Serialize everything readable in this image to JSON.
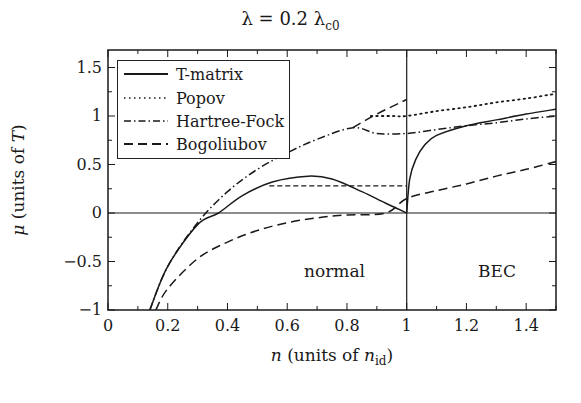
{
  "chart_data": {
    "type": "line",
    "title_main": "λ = 0.2 λ",
    "title_sub": "c0",
    "xlabel": "n (units of n_id)",
    "xlabel_main": "n",
    "xlabel_text": " (units of ",
    "xlabel_var": "n",
    "xlabel_sub": "id",
    "xlabel_close": ")",
    "ylabel": "μ (units of T)",
    "xlim": [
      0,
      1.5
    ],
    "ylim": [
      -1,
      1.7
    ],
    "xticks": [
      "0",
      "0.2",
      "0.4",
      "0.6",
      "0.8",
      "1",
      "1.2",
      "1.4"
    ],
    "yticks": [
      "1.5",
      "1",
      "0.5",
      "0",
      "−0.5",
      "−1"
    ],
    "grid": false,
    "legend_position": "upper left",
    "annotations": [
      {
        "text": "normal",
        "x": 0.75,
        "y": -0.6
      },
      {
        "text": "BEC",
        "x": 1.3,
        "y": -0.6
      }
    ],
    "reference_lines": [
      {
        "type": "horizontal",
        "y": 0
      },
      {
        "type": "vertical",
        "x": 1
      }
    ],
    "series": [
      {
        "name": "T-matrix",
        "style": "solid",
        "x": [
          0.14,
          0.2,
          0.3,
          0.37,
          0.45,
          0.55,
          0.67,
          0.75,
          0.85,
          0.93,
          1.0,
          1.0,
          1.01,
          1.03,
          1.06,
          1.1,
          1.2,
          1.3,
          1.4,
          1.5
        ],
        "values": [
          -1.0,
          -0.55,
          -0.12,
          0.0,
          0.18,
          0.32,
          0.38,
          0.35,
          0.22,
          0.1,
          0.0,
          0.0,
          0.35,
          0.55,
          0.7,
          0.8,
          0.9,
          0.96,
          1.02,
          1.07
        ],
        "extra": {
          "maxwell_plateau": {
            "mu": 0.28,
            "from": 0.54,
            "to": 1.0
          }
        }
      },
      {
        "name": "Popov",
        "style": "dotted",
        "x": [
          0.88,
          0.95,
          1.0,
          1.1,
          1.2,
          1.3,
          1.4,
          1.5
        ],
        "values": [
          1.0,
          1.0,
          1.0,
          1.05,
          1.09,
          1.14,
          1.18,
          1.23
        ]
      },
      {
        "name": "Hartree-Fock",
        "style": "dash-dot",
        "x": [
          0.14,
          0.2,
          0.3,
          0.4,
          0.5,
          0.6,
          0.7,
          0.82,
          0.9,
          1.0,
          1.1,
          1.2,
          1.3,
          1.4,
          1.5
        ],
        "values": [
          -1.0,
          -0.55,
          -0.1,
          0.22,
          0.45,
          0.62,
          0.76,
          0.88,
          0.82,
          0.82,
          0.86,
          0.9,
          0.93,
          0.97,
          1.0
        ]
      },
      {
        "name": "Bogoliubov",
        "style": "dashed",
        "x": [
          0.16,
          0.2,
          0.3,
          0.4,
          0.5,
          0.6,
          0.7,
          0.8,
          0.93,
          1.0,
          1.1,
          1.2,
          1.3,
          1.4,
          1.5
        ],
        "values": [
          -1.0,
          -0.78,
          -0.47,
          -0.3,
          -0.18,
          -0.1,
          -0.05,
          -0.02,
          0.0,
          0.15,
          0.23,
          0.3,
          0.38,
          0.45,
          0.53
        ],
        "extra": {
          "upper_branch": {
            "x": [
              0.82,
              0.9,
              1.0
            ],
            "values": [
              0.88,
              1.02,
              1.17
            ]
          }
        }
      }
    ]
  },
  "legend": {
    "items": [
      {
        "label": "T-matrix",
        "style": "solid"
      },
      {
        "label": "Popov",
        "style": "dotted"
      },
      {
        "label": "Hartree-Fock",
        "style": "dash-dot"
      },
      {
        "label": "Bogoliubov",
        "style": "dashed"
      }
    ]
  },
  "regions": {
    "normal": "normal",
    "bec": "BEC"
  },
  "colors": {
    "line": "#1a1a1a",
    "background": "#ffffff"
  }
}
